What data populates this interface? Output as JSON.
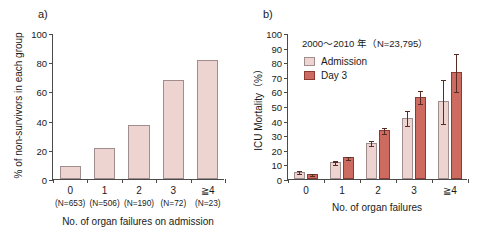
{
  "figure": {
    "panel_a_label": "a)",
    "panel_b_label": "b)"
  },
  "chart_data": [
    {
      "panel": "a)",
      "type": "bar",
      "title": "",
      "xlabel": "No. of organ failures on admission",
      "ylabel": "% of non-survivors in each group",
      "categories": [
        "0",
        "1",
        "2",
        "3",
        "≧4"
      ],
      "category_sublabels": [
        "(N=653)",
        "(N=506)",
        "(N=190)",
        "(N=72)",
        "(N=23)"
      ],
      "values": [
        9,
        21,
        37,
        68,
        81.5
      ],
      "ylim": [
        0,
        100
      ],
      "yticks": [
        0,
        20,
        40,
        60,
        80,
        100
      ],
      "ytick_labels": [
        "0",
        "20",
        "40",
        "60",
        "80",
        "100"
      ],
      "grid": false,
      "legend": "none",
      "bar_color": "#edd4d1",
      "bar_border_color": "#9b8d8d"
    },
    {
      "panel": "b)",
      "type": "bar",
      "title": "2000～2010 年（N=23,795）",
      "xlabel": "No. of organ failures",
      "ylabel": "ICU Mortality（%）",
      "categories": [
        "0",
        "1",
        "2",
        "3",
        "≧4"
      ],
      "ylim": [
        0,
        100
      ],
      "yticks": [
        0,
        10,
        20,
        30,
        40,
        50,
        60,
        70,
        80,
        90,
        100
      ],
      "ytick_labels": [
        "0",
        "10",
        "20",
        "30",
        "40",
        "50",
        "60",
        "70",
        "80",
        "90",
        "100"
      ],
      "grid": false,
      "legend_position": "upper-left",
      "series": [
        {
          "name": "Admission",
          "color": "#edd4d1",
          "border_color": "#a08e8e",
          "values": [
            5.0,
            11.5,
            25.0,
            42.0,
            53.5
          ],
          "errors": [
            0.9,
            1.2,
            1.6,
            5.0,
            15.0
          ]
        },
        {
          "name": "Day 3",
          "color": "#cd6b61",
          "border_color": "#8d3a33",
          "values": [
            3.5,
            15.0,
            33.5,
            56.5,
            73.5
          ],
          "errors": [
            0.7,
            1.0,
            2.0,
            4.5,
            13.0
          ]
        }
      ]
    }
  ]
}
